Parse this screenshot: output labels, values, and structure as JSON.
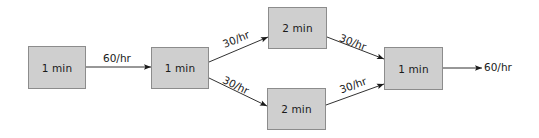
{
  "diagram": {
    "type": "process-flow",
    "nodes": [
      {
        "id": "n1",
        "label": "1 min"
      },
      {
        "id": "n2",
        "label": "1 min"
      },
      {
        "id": "n3",
        "label": "2 min"
      },
      {
        "id": "n4",
        "label": "2 min"
      },
      {
        "id": "n5",
        "label": "1 min"
      }
    ],
    "edges": [
      {
        "from": "n1",
        "to": "n2",
        "label": "60/hr"
      },
      {
        "from": "n2",
        "to": "n3",
        "label": "30/hr"
      },
      {
        "from": "n2",
        "to": "n4",
        "label": "30/hr"
      },
      {
        "from": "n3",
        "to": "n5",
        "label": "30/hr"
      },
      {
        "from": "n4",
        "to": "n5",
        "label": "30/hr"
      },
      {
        "from": "n5",
        "to": "output",
        "label": "60/hr"
      }
    ],
    "colors": {
      "box_fill": "#cfcfcf",
      "box_border": "#8c8c8c",
      "line": "#1a1a1a"
    }
  }
}
